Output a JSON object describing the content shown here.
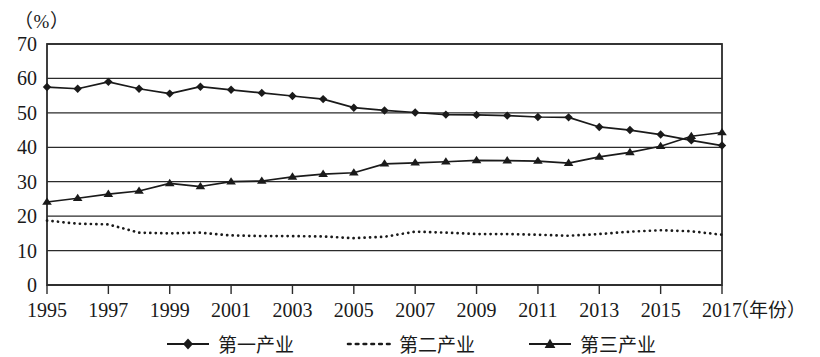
{
  "chart_data": {
    "type": "line",
    "title": "",
    "subtitle": "",
    "unit_label": "（%）",
    "ylabel": "",
    "xlabel": "（年份）",
    "xlim": [
      1995,
      2017
    ],
    "ylim": [
      0,
      70
    ],
    "ytick_step": 10,
    "xtick_step": 2,
    "grid": true,
    "grid_axis": "y",
    "legend_position": "bottom",
    "yticks": [
      "0",
      "10",
      "20",
      "30",
      "40",
      "50",
      "60",
      "70"
    ],
    "xticks": [
      "1995",
      "1997",
      "1999",
      "2001",
      "2003",
      "2005",
      "2007",
      "2009",
      "2011",
      "2013",
      "2015",
      "2017"
    ],
    "x": [
      1995,
      1996,
      1997,
      1998,
      1999,
      2000,
      2001,
      2002,
      2003,
      2004,
      2005,
      2006,
      2007,
      2008,
      2009,
      2010,
      2011,
      2012,
      2013,
      2014,
      2015,
      2016,
      2017
    ],
    "series": [
      {
        "name": "第一产业",
        "style": "solid",
        "marker": "diamond",
        "color": "#1a1a1a",
        "values": [
          57.5,
          57.0,
          59.0,
          57.0,
          55.6,
          57.6,
          56.7,
          55.8,
          54.9,
          54.0,
          51.5,
          50.7,
          50.1,
          49.5,
          49.4,
          49.2,
          48.8,
          48.7,
          45.9,
          45.0,
          43.7,
          42.0,
          40.5
        ]
      },
      {
        "name": "第二产业",
        "style": "dotted",
        "marker": "none",
        "color": "#1a1a1a",
        "values": [
          18.7,
          17.8,
          17.6,
          15.2,
          15.0,
          15.2,
          14.4,
          14.2,
          14.2,
          14.1,
          13.6,
          14.0,
          15.5,
          15.2,
          14.8,
          14.8,
          14.6,
          14.3,
          14.8,
          15.5,
          15.9,
          15.6,
          14.6
        ]
      },
      {
        "name": "第三产业",
        "style": "solid",
        "marker": "triangle",
        "color": "#1a1a1a",
        "values": [
          24.1,
          25.2,
          26.4,
          27.3,
          29.5,
          28.6,
          30.0,
          30.2,
          31.4,
          32.2,
          32.6,
          35.2,
          35.5,
          35.8,
          36.2,
          36.1,
          36.0,
          35.4,
          37.2,
          38.5,
          40.3,
          43.2,
          44.3
        ]
      }
    ]
  },
  "legend": {
    "items": [
      {
        "label": "第一产业",
        "marker": "diamond",
        "style": "solid"
      },
      {
        "label": "第二产业",
        "marker": "none",
        "style": "dotted"
      },
      {
        "label": "第三产业",
        "marker": "triangle",
        "style": "solid"
      }
    ]
  }
}
